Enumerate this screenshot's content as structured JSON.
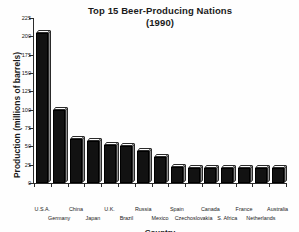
{
  "chart_data": {
    "type": "bar",
    "title": "Top 15 Beer-Producing Nations",
    "subtitle": "(1990)",
    "xlabel": "Country",
    "ylabel": "Production (millions of barrels)",
    "ylim": [
      0,
      225
    ],
    "yticks": [
      0,
      25,
      50,
      75,
      100,
      125,
      150,
      175,
      200,
      225
    ],
    "ytick_labels": [
      "0",
      "25",
      "50",
      "75",
      "100",
      "125",
      "150",
      "175",
      "200",
      "225"
    ],
    "grid": false,
    "legend": "none",
    "bar_style": "3d-block-dark",
    "categories": [
      "U.S.A.",
      "Germany",
      "China",
      "Japan",
      "U.K.",
      "Brazil",
      "Russia",
      "Mexico",
      "Spain",
      "Czechoslovakia",
      "Canada",
      "S. Africa",
      "France",
      "Netherlands",
      "Australia"
    ],
    "values": [
      205,
      100,
      60,
      57,
      52,
      51,
      43,
      35,
      22,
      21,
      21,
      21,
      21,
      21,
      20
    ],
    "series": [
      {
        "name": "Production 1990",
        "values": [
          205,
          100,
          60,
          57,
          52,
          51,
          43,
          35,
          22,
          21,
          21,
          21,
          21,
          21,
          20
        ]
      }
    ]
  },
  "colors": {
    "bar_face": "#121212",
    "bar_top": "#fdfdfd",
    "bar_side": "#8d8d8d",
    "axis": "#2b2b2b",
    "text": "#1a1a1a",
    "background": "#ffffff"
  }
}
